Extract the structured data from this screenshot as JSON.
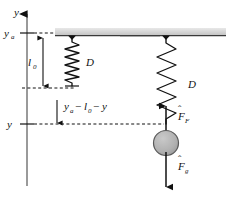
{
  "figure": {
    "background_color": "#ffffff",
    "line_color": "#111111",
    "ceiling_fill": "#d9d9d9",
    "ceiling_edge": "#8a8a8a",
    "mass_fill": "#b3b3b3",
    "mass_edge": "#4d4d4d"
  },
  "axis": {
    "name": "vertical-position-axis",
    "label": "y",
    "arrow_direction": "up",
    "ticks": [
      {
        "id": "ya",
        "label": "y",
        "sub": "a",
        "y_px": 33
      },
      {
        "id": "y",
        "label": "y",
        "sub": "",
        "y_px": 124
      }
    ]
  },
  "labels": {
    "axis_y": "y",
    "tick_ya_base": "y",
    "tick_ya_sub": "a",
    "tick_y": "y",
    "natural_length": "l",
    "natural_length_sub": "0",
    "spring_left": "D",
    "spring_right": "D",
    "extension_expr": {
      "term1_base": "y",
      "term1_sub": "a",
      "op1": "−",
      "term2_base": "l",
      "term2_sub": "0",
      "op2": "−",
      "term3": "y"
    },
    "force_spring_base": "F",
    "force_spring_sub": "F",
    "force_gravity_base": "F",
    "force_gravity_sub": "g",
    "vector_hat": "ˆ"
  },
  "panels": [
    {
      "name": "left-panel-relaxed-spring",
      "description": "Spring at natural length l0 hanging from ceiling",
      "ceiling": {
        "x": 55,
        "y": 28,
        "width": 105,
        "height": 8
      },
      "spring": {
        "center_x": 72,
        "top_y": 38,
        "bottom_y": 85,
        "coils": 9,
        "amplitude": 7,
        "state": "relaxed"
      },
      "dimension_arrow": {
        "name": "l0-dimension",
        "x": 43,
        "top_y": 36,
        "bottom_y": 88
      }
    },
    {
      "name": "right-panel-stretched-spring",
      "description": "Spring stretched by hanging mass, with force vectors",
      "ceiling": {
        "x": 120,
        "y": 28,
        "width": 106,
        "height": 8
      },
      "spring": {
        "center_x": 166,
        "top_y": 38,
        "bottom_y": 122,
        "coils": 7,
        "amplitude": 9,
        "state": "stretched"
      },
      "mass": {
        "center_x": 166,
        "center_y": 143,
        "radius": 12
      },
      "forces": [
        {
          "id": "spring-force",
          "label_base": "F",
          "label_sub": "F",
          "direction": "up",
          "tail_y": 136,
          "head_y": 104
        },
        {
          "id": "gravity-force",
          "label_base": "F",
          "label_sub": "g",
          "direction": "down",
          "tail_y": 152,
          "head_y": 188
        }
      ]
    }
  ],
  "guides": [
    {
      "name": "dashed-guide-ya",
      "y_px": 33,
      "x_start": 8,
      "x_end": 56,
      "style": "dashed"
    },
    {
      "name": "dashed-guide-l0",
      "y_px": 88,
      "x_start": 18,
      "x_end": 72,
      "style": "dashed"
    },
    {
      "name": "dashed-guide-y",
      "y_px": 124,
      "x_start": 18,
      "x_end": 166,
      "style": "dashed"
    },
    {
      "name": "extension-dimension-arrow",
      "x_px": 57,
      "top_y": 100,
      "bottom_y": 124
    }
  ]
}
